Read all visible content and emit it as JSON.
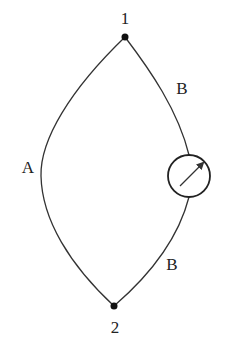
{
  "diagram": {
    "title": "",
    "nodes": [
      {
        "id": "node-1",
        "label": "1"
      },
      {
        "id": "node-2",
        "label": "2"
      }
    ],
    "branches": [
      {
        "id": "branch-a",
        "label": "A",
        "connects": [
          "1",
          "2"
        ]
      },
      {
        "id": "branch-b-upper",
        "label": "B",
        "connects": [
          "1",
          "meter"
        ]
      },
      {
        "id": "branch-b-lower",
        "label": "B",
        "connects": [
          "meter",
          "2"
        ]
      }
    ],
    "meter": {
      "type": "meter-icon",
      "description": "circular meter with diagonal arrow"
    }
  }
}
